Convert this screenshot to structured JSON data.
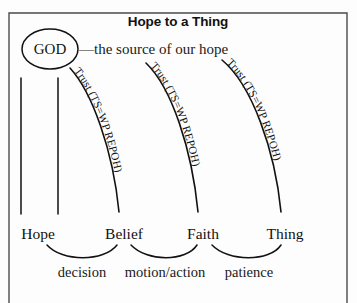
{
  "figure": {
    "title": "Hope to a Thing",
    "god_node": "GOD",
    "source_caption": "—the source of our hope"
  },
  "arcs": [
    {
      "id": "arc-belief",
      "label": "Trust (TS=WP REPOH)"
    },
    {
      "id": "arc-faith",
      "label": "Trust (TS=WP REPOH)"
    },
    {
      "id": "arc-thing",
      "label": "Trust (TS=WP REPOH)"
    }
  ],
  "nodes": [
    {
      "id": "node-hope",
      "label": "Hope"
    },
    {
      "id": "node-belief",
      "label": "Belief"
    },
    {
      "id": "node-faith",
      "label": "Faith"
    },
    {
      "id": "node-thing",
      "label": "Thing"
    }
  ],
  "phases": [
    {
      "id": "phase-decision",
      "label": "decision"
    },
    {
      "id": "phase-motion",
      "label": "motion/action"
    },
    {
      "id": "phase-patience",
      "label": "patience"
    }
  ],
  "colors": {
    "ink": "#111111",
    "frame": "#4a4a4a",
    "background": "#fdfdfd"
  }
}
